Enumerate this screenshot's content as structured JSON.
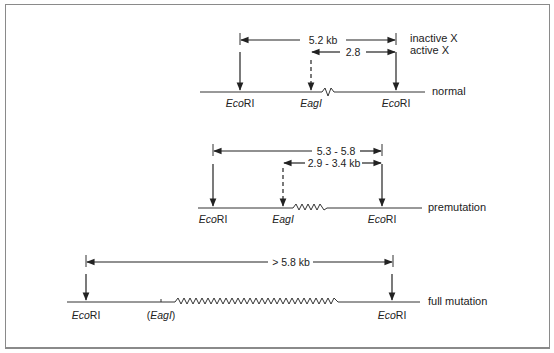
{
  "diagram": {
    "type": "restriction map",
    "rows": [
      {
        "id": "normal",
        "label": "normal",
        "spans": [
          {
            "text": "5.2 kb",
            "side_label": "inactive X"
          },
          {
            "text": "2.8",
            "side_label": "active X"
          }
        ],
        "sites": [
          {
            "name_italic": "Eco",
            "name_roman": "RI"
          },
          {
            "name_italic": "Eag",
            "name_roman": "I"
          },
          {
            "name_italic": "Eco",
            "name_roman": "RI"
          }
        ]
      },
      {
        "id": "premutation",
        "label": "premutation",
        "spans": [
          {
            "text": "5.3 - 5.8"
          },
          {
            "text": "2.9 - 3.4 kb"
          }
        ],
        "sites": [
          {
            "name_italic": "Eco",
            "name_roman": "RI"
          },
          {
            "name_italic": "Eag",
            "name_roman": "I"
          },
          {
            "name_italic": "Eco",
            "name_roman": "RI"
          }
        ]
      },
      {
        "id": "full_mutation",
        "label": "full mutation",
        "spans": [
          {
            "text": "> 5.8 kb"
          }
        ],
        "sites": [
          {
            "name_italic": "Eco",
            "name_roman": "RI"
          },
          {
            "name_prefix": "(",
            "name_italic": "Eag",
            "name_roman": "I",
            "name_suffix": ")"
          },
          {
            "name_italic": "Eco",
            "name_roman": "RI"
          }
        ]
      }
    ]
  }
}
